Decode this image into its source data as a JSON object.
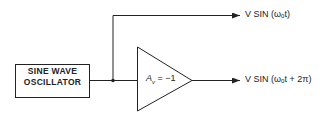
{
  "diagram": {
    "source_block": {
      "line1": "SINE WAVE",
      "line2": "OSCILLATOR"
    },
    "amplifier": {
      "gain_label": "A",
      "gain_subscript": "v",
      "gain_value": " = −1"
    },
    "outputs": [
      {
        "label": "V SIN (ωₒt)"
      },
      {
        "label": "V SIN (ωₒt + 2π)"
      }
    ],
    "colors": {
      "stroke": "#222222",
      "background": "#ffffff"
    }
  }
}
